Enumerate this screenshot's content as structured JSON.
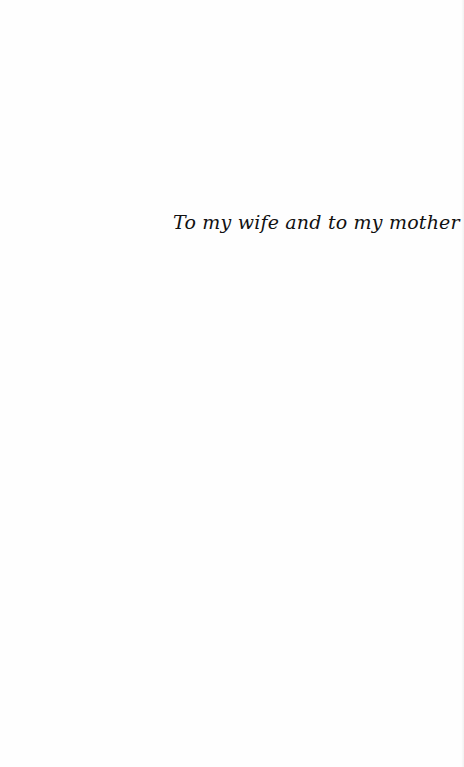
{
  "page": {
    "dedication": "To my wife and to my mother"
  }
}
